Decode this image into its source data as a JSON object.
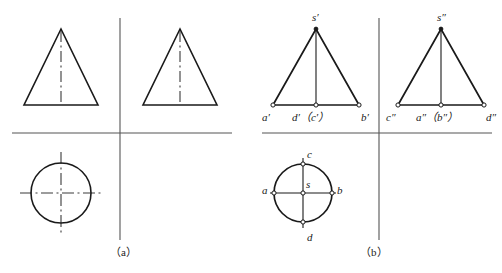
{
  "figure": {
    "background_color": "#ffffff",
    "line_color": "#1a1a1a",
    "axis_color": "#555555",
    "width": 502,
    "height": 273
  },
  "captions": [
    {
      "name": "caption-a",
      "text": "（a）",
      "x": 131,
      "y": 249
    },
    {
      "name": "caption-b",
      "text": "（b）",
      "x": 381,
      "y": 249
    }
  ],
  "panel_a": {
    "caption": "（a）",
    "description": "Unlabelled projection: two front/side triangular views above the reference line and one circular top view below, with dash-dot centre lines.",
    "reference_line": {
      "x1": 12,
      "y1": 133,
      "x2": 232,
      "y2": 133
    },
    "vertical_line": {
      "x1": 120,
      "y1": 18,
      "x2": 120,
      "y2": 240
    },
    "triangles": [
      {
        "name": "front-view-triangle-a",
        "apex_x": 61,
        "apex_y": 29,
        "base_left_x": 24,
        "base_right_x": 98,
        "base_y": 105,
        "centerline": true
      },
      {
        "name": "side-view-triangle-a",
        "apex_x": 180,
        "apex_y": 29,
        "base_left_x": 143,
        "base_right_x": 217,
        "base_y": 105,
        "centerline": true
      }
    ],
    "circle": {
      "name": "top-view-circle-a",
      "cx": 61,
      "cy": 193,
      "r": 30,
      "centerlines": "dash-dot"
    }
  },
  "panel_b": {
    "caption": "（b）",
    "description": "Labelled projection: front view with points a', d'(c'), b', s'; side view with points c″, a″(b″), d″, s″; top view circle with points a, b, c, d and centre s.",
    "reference_line": {
      "x1": 262,
      "y1": 133,
      "x2": 492,
      "y2": 133
    },
    "vertical_line": {
      "x1": 379,
      "y1": 18,
      "x2": 379,
      "y2": 240
    },
    "front_view": {
      "name": "front-view-triangle-b",
      "apex_x": 316,
      "apex_y": 29,
      "base_left_x": 273,
      "base_right_x": 359,
      "base_y": 105,
      "labels": {
        "apex": "s′",
        "base_left": "a′",
        "base_mid": "d′（c′）",
        "base_right": "b′"
      }
    },
    "side_view": {
      "name": "side-view-triangle-b",
      "apex_x": 441,
      "apex_y": 29,
      "base_left_x": 398,
      "base_right_x": 484,
      "base_y": 105,
      "labels": {
        "apex": "s″",
        "base_left": "c″",
        "base_mid": "a″（b″）",
        "base_right": "d″"
      }
    },
    "top_view": {
      "name": "top-view-circle-b",
      "cx": 303,
      "cy": 193,
      "r": 29,
      "labels": {
        "left": "a",
        "right": "b",
        "top": "c",
        "bottom": "d",
        "center": "s"
      }
    }
  },
  "label_positions": [
    {
      "name": "label-front-apex-s-prime",
      "text": "s′",
      "x": 312,
      "y": 12,
      "bind": "panel_b.front_view.labels.apex"
    },
    {
      "name": "label-front-base-left-a",
      "text": "a′",
      "x": 262,
      "y": 113,
      "bind": "panel_b.front_view.labels.base_left"
    },
    {
      "name": "label-front-base-mid-dc",
      "text": "d′（c′）",
      "x": 296,
      "y": 113,
      "bind": "panel_b.front_view.labels.base_mid"
    },
    {
      "name": "label-front-base-right-b",
      "text": "b′",
      "x": 361,
      "y": 113,
      "bind": "panel_b.front_view.labels.base_right"
    },
    {
      "name": "label-side-apex-s-dprime",
      "text": "s″",
      "x": 437,
      "y": 12,
      "bind": "panel_b.side_view.labels.apex"
    },
    {
      "name": "label-side-base-left-c",
      "text": "c″",
      "x": 387,
      "y": 113,
      "bind": "panel_b.side_view.labels.base_left"
    },
    {
      "name": "label-side-base-mid-ab",
      "text": "a″（b″）",
      "x": 420,
      "y": 113,
      "bind": "panel_b.side_view.labels.base_mid"
    },
    {
      "name": "label-side-base-right-d",
      "text": "d″",
      "x": 486,
      "y": 113,
      "bind": "panel_b.side_view.labels.base_right"
    },
    {
      "name": "label-top-left-a",
      "text": "a",
      "x": 262,
      "y": 186,
      "bind": "panel_b.top_view.labels.left"
    },
    {
      "name": "label-top-right-b",
      "text": "b",
      "x": 336,
      "y": 186,
      "bind": "panel_b.top_view.labels.right"
    },
    {
      "name": "label-top-top-c",
      "text": "c",
      "x": 307,
      "y": 150,
      "bind": "panel_b.top_view.labels.top"
    },
    {
      "name": "label-top-bottom-d",
      "text": "d",
      "x": 307,
      "y": 234,
      "bind": "panel_b.top_view.labels.bottom"
    },
    {
      "name": "label-top-center-s",
      "text": "s",
      "x": 306,
      "y": 180,
      "bind": "panel_b.top_view.labels.center"
    }
  ]
}
